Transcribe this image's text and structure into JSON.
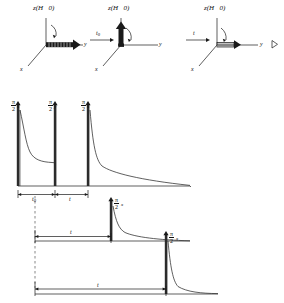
{
  "figure": {
    "kind": "nmr-pulse-sequence-and-vector-diagrams",
    "ink_color": "#111111"
  },
  "vector_diagrams": [
    {
      "id": "panel-a",
      "z_label": "z(H⃗0)",
      "x_label": "x",
      "y_label": "y",
      "magnetization_direction": "along-y",
      "arc": "angle-from-z-to-y"
    },
    {
      "id": "panel-b",
      "z_label": "z(H⃗0)",
      "x_label": "x",
      "y_label": "y",
      "magnetization_direction": "along-z",
      "arc": "angle-from-z-to-y"
    },
    {
      "id": "panel-c",
      "z_label": "z(H⃗0)",
      "x_label": "x",
      "y_label": "y",
      "magnetization_direction": "along-y",
      "arc": "angle-from-z-to-y",
      "extra_glyph": "▷"
    }
  ],
  "transition_arrows": [
    {
      "id": "arrow-t0",
      "label_main": "t",
      "label_sub": "0"
    },
    {
      "id": "arrow-t",
      "label_main": "t",
      "label_sub": ""
    }
  ],
  "pulse_rows": [
    {
      "id": "row-1",
      "pulses": [
        {
          "id": "p1",
          "num": "π",
          "den": "2",
          "phase": "x"
        },
        {
          "id": "p2",
          "num": "π",
          "den": "2",
          "phase": "y"
        },
        {
          "id": "p3",
          "num": "π",
          "den": "2",
          "phase": "x"
        }
      ],
      "intervals": [
        {
          "id": "i1",
          "label_main": "t",
          "label_sub": "0"
        },
        {
          "id": "i2",
          "label_main": "t",
          "label_sub": ""
        }
      ]
    },
    {
      "id": "row-2",
      "pulses": [
        {
          "id": "p4",
          "num": "π",
          "den": "2",
          "phase": "x"
        }
      ],
      "intervals": [
        {
          "id": "i3",
          "label_main": "t",
          "label_sub": ""
        }
      ]
    },
    {
      "id": "row-3",
      "pulses": [
        {
          "id": "p5",
          "num": "π",
          "den": "2",
          "phase": "x"
        }
      ],
      "intervals": [
        {
          "id": "i4",
          "label_main": "t",
          "label_sub": ""
        }
      ]
    }
  ]
}
